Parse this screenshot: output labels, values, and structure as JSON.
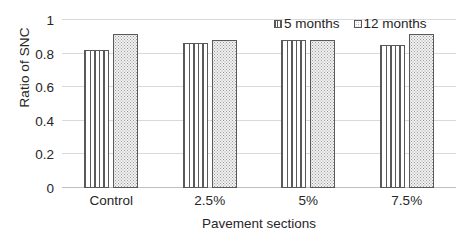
{
  "chart_data": {
    "type": "bar",
    "title": "",
    "xlabel": "Pavement sections",
    "ylabel": "Ratio of SNC",
    "categories": [
      "Control",
      "2.5%",
      "5%",
      "7.5%"
    ],
    "series": [
      {
        "name": "5 months",
        "values": [
          0.82,
          0.862,
          0.884,
          0.849
        ]
      },
      {
        "name": "12 months",
        "values": [
          0.915,
          0.884,
          0.882,
          0.917
        ]
      }
    ],
    "ylim": [
      0,
      1
    ],
    "yticks": [
      "0",
      "0.2",
      "0.4",
      "0.6",
      "0.8",
      "1"
    ],
    "ytick_values": [
      0,
      0.2,
      0.4,
      0.6,
      0.8,
      1
    ],
    "grid": true,
    "legend_position": "top-right",
    "patterns": [
      "vertical-stripes",
      "dotted-stipple"
    ],
    "colors": {
      "axis_text": "#262626",
      "gridline": "#d9d9d9",
      "bar_outline": "#595959",
      "series_0_fill": "#ffffff",
      "series_1_fill": "#f2f2f2",
      "background": "#ffffff"
    }
  },
  "legend": {
    "entries": [
      {
        "label": "5 months"
      },
      {
        "label": "12 months"
      }
    ]
  }
}
